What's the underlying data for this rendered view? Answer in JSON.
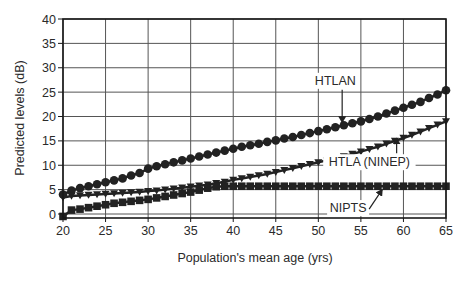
{
  "chart_data": {
    "type": "line",
    "title": "",
    "xlabel": "Population's mean age (yrs)",
    "ylabel": "Predicted levels (dB)",
    "xlim": [
      20,
      65
    ],
    "ylim": [
      -1,
      40
    ],
    "xticks": [
      20,
      25,
      30,
      35,
      40,
      45,
      50,
      55,
      60,
      65
    ],
    "yticks": [
      0,
      5,
      10,
      15,
      20,
      25,
      30,
      35,
      40
    ],
    "grid": true,
    "legend": "none (inline annotations with arrows)",
    "x": [
      20,
      21,
      22,
      23,
      24,
      25,
      26,
      27,
      28,
      29,
      30,
      31,
      32,
      33,
      34,
      35,
      36,
      37,
      38,
      39,
      40,
      41,
      42,
      43,
      44,
      45,
      46,
      47,
      48,
      49,
      50,
      51,
      52,
      53,
      54,
      55,
      56,
      57,
      58,
      59,
      60,
      61,
      62,
      63,
      64,
      65
    ],
    "series": [
      {
        "name": "HTLAN",
        "marker": "circle",
        "values": [
          4.0,
          4.8,
          5.3,
          5.7,
          6.1,
          6.5,
          6.9,
          7.3,
          7.9,
          8.4,
          9.3,
          9.8,
          10.2,
          10.6,
          11.0,
          11.4,
          11.8,
          12.2,
          12.6,
          13.0,
          13.4,
          13.8,
          14.1,
          14.4,
          14.8,
          15.1,
          15.5,
          15.8,
          16.2,
          16.6,
          17.0,
          17.4,
          17.8,
          18.2,
          18.6,
          19.0,
          19.5,
          20.0,
          20.6,
          21.2,
          21.8,
          22.4,
          23.0,
          23.8,
          24.5,
          25.4
        ]
      },
      {
        "name": "HTLA (NINEP)",
        "marker": "triangle-down",
        "values": [
          3.4,
          3.7,
          3.8,
          3.9,
          4.0,
          4.1,
          4.2,
          4.3,
          4.4,
          4.5,
          4.7,
          4.8,
          5.0,
          5.2,
          5.4,
          5.6,
          5.8,
          6.0,
          6.3,
          6.6,
          7.0,
          7.3,
          7.6,
          7.9,
          8.2,
          8.6,
          9.0,
          9.4,
          9.8,
          10.2,
          10.6,
          11.0,
          11.4,
          11.8,
          12.3,
          12.8,
          13.3,
          13.8,
          14.4,
          15.0,
          15.6,
          16.2,
          16.9,
          17.6,
          18.3,
          19.0
        ]
      },
      {
        "name": "NIPTS",
        "marker": "square",
        "values": [
          -0.5,
          0.8,
          1.0,
          1.3,
          1.6,
          1.9,
          2.2,
          2.4,
          2.6,
          2.8,
          3.0,
          3.3,
          3.6,
          3.9,
          4.2,
          4.5,
          4.9,
          5.3,
          5.6,
          5.7,
          5.7,
          5.7,
          5.7,
          5.7,
          5.7,
          5.7,
          5.7,
          5.7,
          5.7,
          5.7,
          5.7,
          5.7,
          5.7,
          5.7,
          5.7,
          5.7,
          5.7,
          5.7,
          5.7,
          5.7,
          5.7,
          5.7,
          5.7,
          5.7,
          5.7,
          5.7
        ]
      }
    ],
    "annotations": [
      {
        "text": "HTLAN",
        "label_x": 52,
        "label_y": 26.5,
        "arrow_to_x": 52.8,
        "arrow_to_y": 18.8
      },
      {
        "text": "HTLA (NINEP)",
        "label_x": 56,
        "label_y": 9.8,
        "arrow_to_x": 59.2,
        "arrow_to_y": 15.5
      },
      {
        "text": "NIPTS",
        "label_x": 53.5,
        "label_y": 0.4,
        "arrow_to_x": 57.5,
        "arrow_to_y": 5.0
      }
    ]
  },
  "colors": {
    "series": "#222222",
    "grid": "#555555",
    "frame": "#1a1a1a",
    "background": "#ffffff"
  }
}
